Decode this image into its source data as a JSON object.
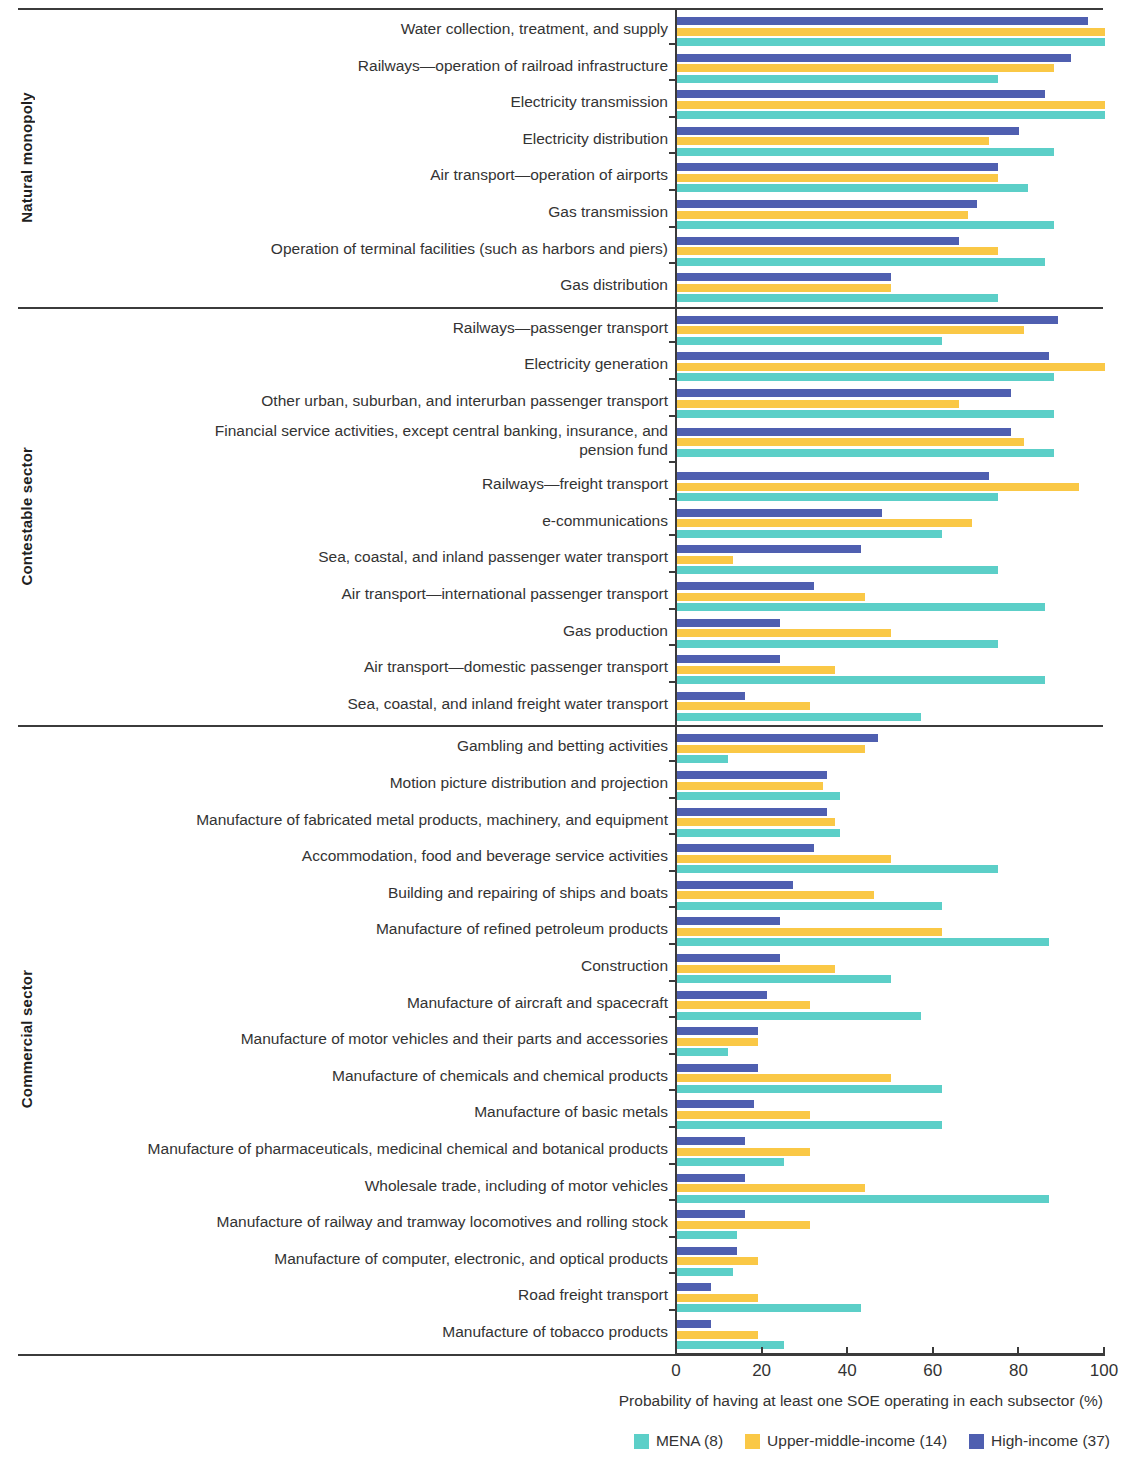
{
  "axis": {
    "x_ticks": [
      0,
      20,
      40,
      60,
      80,
      100
    ],
    "x_label": "Probability of having at least one SOE operating in each subsector (%)",
    "xlim": [
      0,
      100
    ]
  },
  "legend": [
    {
      "label": "MENA (8)",
      "color": "#5ccfc8",
      "key": "mena"
    },
    {
      "label": "Upper-middle-income (14)",
      "color": "#fac846",
      "key": "umic"
    },
    {
      "label": "High-income (37)",
      "color": "#4f5fb0",
      "key": "high"
    }
  ],
  "sectors": [
    {
      "name": "Natural monopoly"
    },
    {
      "name": "Contestable sector"
    },
    {
      "name": "Commercial sector"
    }
  ],
  "chart_data": {
    "type": "bar",
    "orientation": "horizontal",
    "title": "",
    "xlabel": "Probability of having at least one SOE operating in each subsector (%)",
    "ylabel": "",
    "xlim": [
      0,
      100
    ],
    "grid": false,
    "legend_position": "bottom-right",
    "series": [
      {
        "name": "MENA (8)",
        "color": "#5ccfc8"
      },
      {
        "name": "Upper-middle-income (14)",
        "color": "#fac846"
      },
      {
        "name": "High-income (37)",
        "color": "#4f5fb0"
      }
    ],
    "groups": [
      {
        "sector": "Natural monopoly",
        "categories": [
          {
            "label": "Water collection, treatment, and supply",
            "mena": 100,
            "umic": 100,
            "high": 96
          },
          {
            "label": "Railways—operation of railroad infrastructure",
            "mena": 75,
            "umic": 88,
            "high": 92
          },
          {
            "label": "Electricity transmission",
            "mena": 100,
            "umic": 100,
            "high": 86
          },
          {
            "label": "Electricity distribution",
            "mena": 88,
            "umic": 73,
            "high": 80
          },
          {
            "label": "Air transport—operation of airports",
            "mena": 82,
            "umic": 75,
            "high": 75
          },
          {
            "label": "Gas transmission",
            "mena": 88,
            "umic": 68,
            "high": 70
          },
          {
            "label": "Operation of terminal facilities (such as harbors and piers)",
            "mena": 86,
            "umic": 75,
            "high": 66
          },
          {
            "label": "Gas distribution",
            "mena": 75,
            "umic": 50,
            "high": 50
          }
        ]
      },
      {
        "sector": "Contestable sector",
        "categories": [
          {
            "label": "Railways—passenger transport",
            "mena": 62,
            "umic": 81,
            "high": 89
          },
          {
            "label": "Electricity generation",
            "mena": 88,
            "umic": 100,
            "high": 87
          },
          {
            "label": "Other urban, suburban, and interurban passenger transport",
            "mena": 88,
            "umic": 66,
            "high": 78
          },
          {
            "label": "Financial service activities, except central banking, insurance, and\npension fund",
            "mena": 88,
            "umic": 81,
            "high": 78
          },
          {
            "label": "Railways—freight transport",
            "mena": 75,
            "umic": 94,
            "high": 73
          },
          {
            "label": "e-communications",
            "mena": 62,
            "umic": 69,
            "high": 48
          },
          {
            "label": "Sea, coastal, and inland passenger water transport",
            "mena": 75,
            "umic": 13,
            "high": 43
          },
          {
            "label": "Air transport—international passenger transport",
            "mena": 86,
            "umic": 44,
            "high": 32
          },
          {
            "label": "Gas production",
            "mena": 75,
            "umic": 50,
            "high": 24
          },
          {
            "label": "Air transport—domestic passenger transport",
            "mena": 86,
            "umic": 37,
            "high": 24
          },
          {
            "label": "Sea, coastal, and inland freight water transport",
            "mena": 57,
            "umic": 31,
            "high": 16
          }
        ]
      },
      {
        "sector": "Commercial sector",
        "categories": [
          {
            "label": "Gambling and betting activities",
            "mena": 12,
            "umic": 44,
            "high": 47
          },
          {
            "label": "Motion picture distribution and projection",
            "mena": 38,
            "umic": 34,
            "high": 35
          },
          {
            "label": "Manufacture of fabricated metal products, machinery, and equipment",
            "mena": 38,
            "umic": 37,
            "high": 35
          },
          {
            "label": "Accommodation, food and beverage service activities",
            "mena": 75,
            "umic": 50,
            "high": 32
          },
          {
            "label": "Building and repairing of ships and boats",
            "mena": 62,
            "umic": 46,
            "high": 27
          },
          {
            "label": "Manufacture of refined petroleum products",
            "mena": 87,
            "umic": 62,
            "high": 24
          },
          {
            "label": "Construction",
            "mena": 50,
            "umic": 37,
            "high": 24
          },
          {
            "label": "Manufacture of aircraft and spacecraft",
            "mena": 57,
            "umic": 31,
            "high": 21
          },
          {
            "label": "Manufacture of motor vehicles and their parts and accessories",
            "mena": 12,
            "umic": 19,
            "high": 19
          },
          {
            "label": "Manufacture of chemicals and chemical products",
            "mena": 62,
            "umic": 50,
            "high": 19
          },
          {
            "label": "Manufacture of basic metals",
            "mena": 62,
            "umic": 31,
            "high": 18
          },
          {
            "label": "Manufacture of pharmaceuticals, medicinal chemical and botanical products",
            "mena": 25,
            "umic": 31,
            "high": 16
          },
          {
            "label": "Wholesale trade, including of motor vehicles",
            "mena": 87,
            "umic": 44,
            "high": 16
          },
          {
            "label": "Manufacture of railway and tramway locomotives and rolling stock",
            "mena": 14,
            "umic": 31,
            "high": 16
          },
          {
            "label": "Manufacture of computer, electronic, and optical products",
            "mena": 13,
            "umic": 19,
            "high": 14
          },
          {
            "label": "Road freight transport",
            "mena": 43,
            "umic": 19,
            "high": 8
          },
          {
            "label": "Manufacture of tobacco products",
            "mena": 25,
            "umic": 19,
            "high": 8
          }
        ]
      }
    ]
  }
}
